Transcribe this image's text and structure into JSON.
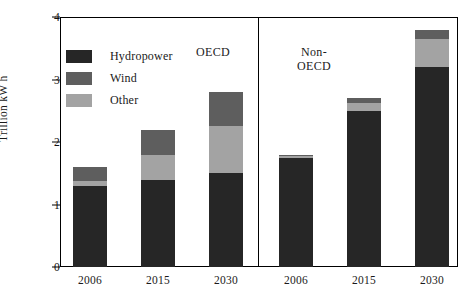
{
  "chart_data": {
    "type": "bar",
    "stacked": true,
    "title": "",
    "subtitle": "",
    "xlabel": "",
    "ylabel": "Trillion kW h",
    "ylim": [
      0,
      4
    ],
    "ytick_labels": [
      "0",
      "1",
      "2",
      "3",
      "4"
    ],
    "ytick_values": [
      0,
      1,
      2,
      3,
      4
    ],
    "grid": false,
    "legend_position": "upper-left-inside",
    "groups": [
      "OECD",
      "Non-OECD"
    ],
    "categories": [
      "2006",
      "2015",
      "2030",
      "2006",
      "2015",
      "2030"
    ],
    "group_of_category": [
      "OECD",
      "OECD",
      "OECD",
      "Non-OECD",
      "Non-OECD",
      "Non-OECD"
    ],
    "series": [
      {
        "name": "Hydropower",
        "color": "#262626",
        "values": [
          1.3,
          1.4,
          1.5,
          1.75,
          2.5,
          3.2
        ]
      },
      {
        "name": "Other",
        "color": "#a3a3a3",
        "values": [
          0.08,
          0.4,
          0.75,
          0.02,
          0.13,
          0.45
        ]
      },
      {
        "name": "Wind",
        "color": "#5e5e5e",
        "values": [
          0.22,
          0.4,
          0.55,
          0.03,
          0.07,
          0.15
        ]
      }
    ],
    "stack_order_bottom_to_top": [
      "Hydropower",
      "Other",
      "Wind"
    ],
    "totals": [
      1.6,
      2.2,
      2.8,
      1.8,
      2.7,
      3.8
    ],
    "annotations": []
  },
  "legend": {
    "items": [
      {
        "label": "Hydropower",
        "color": "#262626",
        "swatch_name": "legend-swatch-hydropower"
      },
      {
        "label": "Wind",
        "color": "#5e5e5e",
        "swatch_name": "legend-swatch-wind"
      },
      {
        "label": "Other",
        "color": "#a3a3a3",
        "swatch_name": "legend-swatch-other"
      }
    ]
  },
  "axes": {
    "y_title": "Trillion kW h",
    "y_labels": [
      "4",
      "3",
      "2",
      "1",
      "0"
    ],
    "x_labels": [
      "2006",
      "2015",
      "2030",
      "2006",
      "2015",
      "2030"
    ]
  },
  "group_labels": {
    "oecd": "OECD",
    "non_oecd": "Non-\nOECD",
    "non_oecd_line1": "Non-",
    "non_oecd_line2": "OECD"
  },
  "colors": {
    "hydropower": "#262626",
    "wind": "#5e5e5e",
    "other": "#a3a3a3",
    "axis": "#000000",
    "background": "#ffffff"
  }
}
